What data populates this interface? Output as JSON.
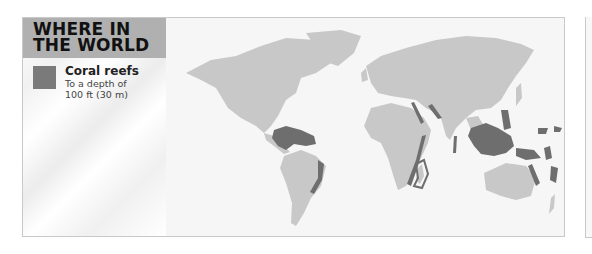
{
  "panel": {
    "title_line1": "WHERE IN",
    "title_line2": "THE WORLD"
  },
  "legend": {
    "items": [
      {
        "label": "Coral reefs",
        "description_line1": "To a depth of",
        "description_line2": "100 ft (30 m)",
        "color": "#7a7a7a"
      }
    ]
  },
  "map": {
    "type": "world-distribution-map",
    "land_color": "#c8c8c8",
    "water_color": "#f6f6f6",
    "highlight_color": "#6e6e6e",
    "highlighted_regions": [
      "Caribbean Sea / Gulf of Mexico",
      "Brazil east coast",
      "Red Sea",
      "East African coast",
      "Madagascar",
      "Persian Gulf",
      "India / Maldives",
      "Southeast Asia / Indonesia / Philippines",
      "Great Barrier Reef",
      "New Guinea",
      "Pacific islands (Solomon, Vanuatu, Fiji)"
    ]
  }
}
